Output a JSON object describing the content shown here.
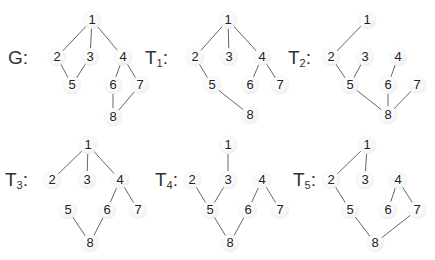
{
  "graphs": [
    {
      "id": "G",
      "label": "G",
      "sub": "",
      "label_pos": [
        8,
        58
      ],
      "nodes": {
        "1": [
          92,
          20
        ],
        "2": [
          57,
          57
        ],
        "3": [
          90,
          57
        ],
        "4": [
          123,
          57
        ],
        "5": [
          72,
          85
        ],
        "6": [
          113,
          85
        ],
        "7": [
          140,
          85
        ],
        "8": [
          113,
          117
        ]
      },
      "edges": [
        [
          "1",
          "2"
        ],
        [
          "1",
          "3"
        ],
        [
          "1",
          "4"
        ],
        [
          "2",
          "5"
        ],
        [
          "3",
          "5"
        ],
        [
          "4",
          "6"
        ],
        [
          "4",
          "7"
        ],
        [
          "6",
          "8"
        ],
        [
          "7",
          "8"
        ]
      ]
    },
    {
      "id": "T1",
      "label": "T",
      "sub": "1",
      "label_pos": [
        145,
        58
      ],
      "nodes": {
        "1": [
          228,
          20
        ],
        "2": [
          195,
          57
        ],
        "3": [
          229,
          57
        ],
        "4": [
          262,
          57
        ],
        "5": [
          212,
          85
        ],
        "6": [
          250,
          85
        ],
        "7": [
          280,
          85
        ],
        "8": [
          250,
          115
        ]
      },
      "edges": [
        [
          "1",
          "2"
        ],
        [
          "1",
          "3"
        ],
        [
          "1",
          "4"
        ],
        [
          "2",
          "5"
        ],
        [
          "4",
          "6"
        ],
        [
          "4",
          "7"
        ],
        [
          "5",
          "8"
        ]
      ]
    },
    {
      "id": "T2",
      "label": "T",
      "sub": "2",
      "label_pos": [
        288,
        58
      ],
      "nodes": {
        "1": [
          367,
          20
        ],
        "2": [
          331,
          57
        ],
        "3": [
          365,
          57
        ],
        "4": [
          398,
          57
        ],
        "5": [
          350,
          85
        ],
        "6": [
          388,
          85
        ],
        "7": [
          417,
          85
        ],
        "8": [
          388,
          115
        ]
      },
      "edges": [
        [
          "1",
          "2"
        ],
        [
          "2",
          "5"
        ],
        [
          "3",
          "5"
        ],
        [
          "4",
          "6"
        ],
        [
          "5",
          "8"
        ],
        [
          "6",
          "8"
        ],
        [
          "7",
          "8"
        ]
      ]
    },
    {
      "id": "T3",
      "label": "T",
      "sub": "3",
      "label_pos": [
        5,
        180
      ],
      "nodes": {
        "1": [
          88,
          145
        ],
        "2": [
          52,
          180
        ],
        "3": [
          87,
          180
        ],
        "4": [
          120,
          180
        ],
        "5": [
          68,
          210
        ],
        "6": [
          107,
          210
        ],
        "7": [
          138,
          210
        ],
        "8": [
          90,
          243
        ]
      },
      "edges": [
        [
          "1",
          "2"
        ],
        [
          "1",
          "3"
        ],
        [
          "1",
          "4"
        ],
        [
          "4",
          "6"
        ],
        [
          "4",
          "7"
        ],
        [
          "5",
          "8"
        ],
        [
          "6",
          "8"
        ]
      ]
    },
    {
      "id": "T4",
      "label": "T",
      "sub": "4",
      "label_pos": [
        155,
        180
      ],
      "nodes": {
        "1": [
          228,
          145
        ],
        "2": [
          192,
          180
        ],
        "3": [
          228,
          180
        ],
        "4": [
          262,
          180
        ],
        "5": [
          210,
          210
        ],
        "6": [
          248,
          210
        ],
        "7": [
          280,
          210
        ],
        "8": [
          230,
          243
        ]
      },
      "edges": [
        [
          "1",
          "3"
        ],
        [
          "2",
          "5"
        ],
        [
          "3",
          "5"
        ],
        [
          "4",
          "6"
        ],
        [
          "4",
          "7"
        ],
        [
          "5",
          "8"
        ],
        [
          "6",
          "8"
        ]
      ]
    },
    {
      "id": "T5",
      "label": "T",
      "sub": "5",
      "label_pos": [
        293,
        180
      ],
      "nodes": {
        "1": [
          367,
          145
        ],
        "2": [
          331,
          180
        ],
        "3": [
          365,
          180
        ],
        "4": [
          398,
          180
        ],
        "5": [
          350,
          210
        ],
        "6": [
          388,
          210
        ],
        "7": [
          417,
          210
        ],
        "8": [
          375,
          243
        ]
      },
      "edges": [
        [
          "1",
          "2"
        ],
        [
          "1",
          "3"
        ],
        [
          "2",
          "5"
        ],
        [
          "4",
          "6"
        ],
        [
          "4",
          "7"
        ],
        [
          "5",
          "8"
        ],
        [
          "7",
          "8"
        ]
      ]
    }
  ],
  "colors": {
    "edge": "#666666",
    "text": "#333333",
    "background": "#ffffff"
  }
}
